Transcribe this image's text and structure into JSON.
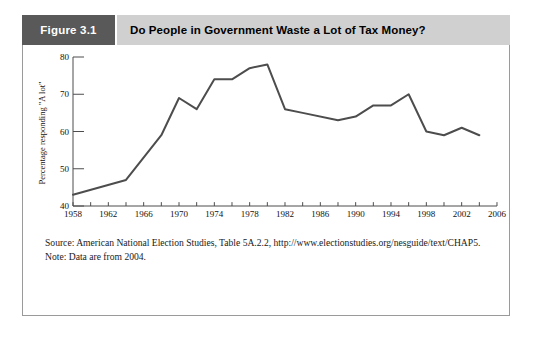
{
  "figure": {
    "tab_label": "Figure 3.1",
    "title": "Do People in Government Waste a Lot of Tax Money?",
    "source_text": "Source: American National Election Studies, Table 5A.2.2, http://www.electionstudies.org/nesguide/text/CHAP5.",
    "note_text": "Note: Data are from 2004."
  },
  "colors": {
    "tab_background": "#595959",
    "title_background": "#d0d0d0",
    "panel_border": "#9a9a9a",
    "line": "#4d4d4d",
    "axis": "#4d4d4d",
    "text": "#111111"
  },
  "chart_data": {
    "type": "line",
    "title": "Do People in Government Waste a Lot of Tax Money?",
    "xlabel": "",
    "ylabel": "Percentage responding \"A lot\"",
    "xlim": [
      1958,
      2006
    ],
    "ylim": [
      40,
      80
    ],
    "grid": false,
    "legend": null,
    "x_major_ticks": [
      1958,
      1962,
      1966,
      1970,
      1974,
      1978,
      1982,
      1986,
      1990,
      1994,
      1998,
      2002,
      2006
    ],
    "x_minor_ticks": [
      1960,
      1964,
      1968,
      1972,
      1976,
      1980,
      1984,
      1988,
      1992,
      1996,
      2000,
      2004
    ],
    "x_tick_labels": [
      "1958",
      "1962",
      "1966",
      "1970",
      "1974",
      "1978",
      "1982",
      "1986",
      "1990",
      "1994",
      "1998",
      "2002",
      "2006"
    ],
    "y_ticks": [
      40,
      50,
      60,
      70,
      80
    ],
    "y_tick_labels": [
      "40",
      "50",
      "60",
      "70",
      "80"
    ],
    "series": [
      {
        "name": "Percentage responding \"A lot\"",
        "x": [
          1958,
          1964,
          1968,
          1970,
          1972,
          1974,
          1976,
          1978,
          1980,
          1982,
          1984,
          1988,
          1990,
          1992,
          1994,
          1996,
          1998,
          2000,
          2002,
          2004
        ],
        "values": [
          43,
          47,
          59,
          69,
          66,
          74,
          74,
          77,
          78,
          66,
          65,
          63,
          64,
          67,
          67,
          70,
          60,
          59,
          61,
          59
        ]
      }
    ]
  }
}
